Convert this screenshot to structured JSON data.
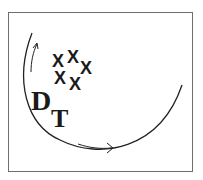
{
  "diagram": {
    "frame": {
      "stroke": "#6e6e6e"
    },
    "stroke_color": "#222222",
    "markers": [
      {
        "label": "X",
        "x": 58,
        "y": 67
      },
      {
        "label": "X",
        "x": 73,
        "y": 63
      },
      {
        "label": "X",
        "x": 86,
        "y": 74
      },
      {
        "label": "X",
        "x": 60,
        "y": 84
      },
      {
        "label": "X",
        "x": 75,
        "y": 90
      }
    ],
    "labels": {
      "main": "D",
      "subscript": "T"
    },
    "arrows": [
      {
        "name": "arrow-up",
        "direction": "up"
      },
      {
        "name": "arrow-right",
        "direction": "right"
      }
    ]
  }
}
